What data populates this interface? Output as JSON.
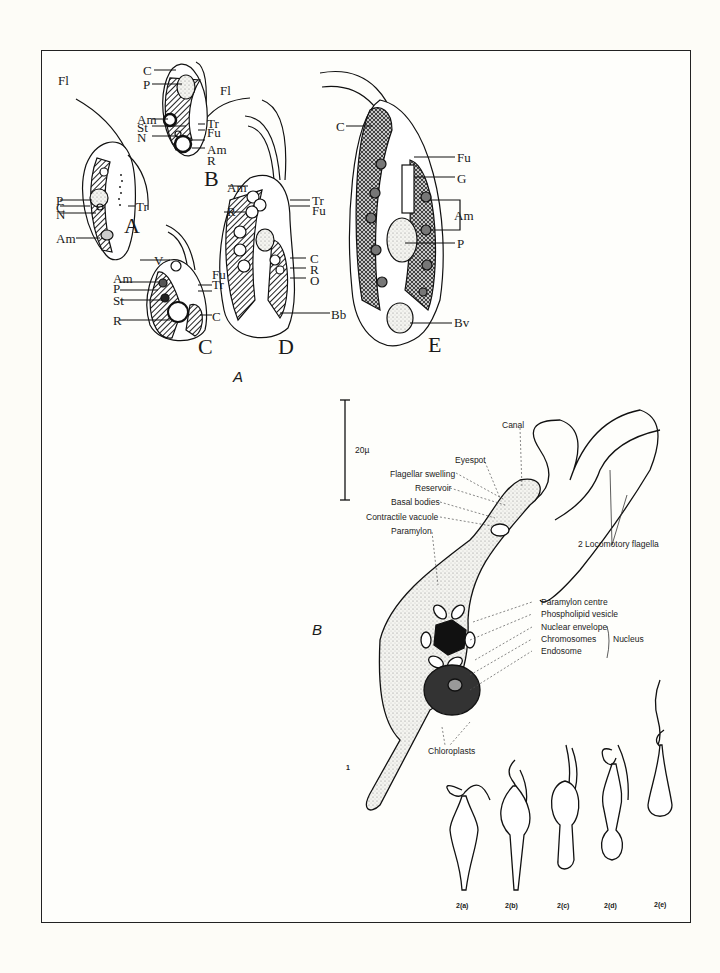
{
  "figure": {
    "panel_A": {
      "label": "A",
      "cells": [
        {
          "id": "A",
          "labels": [
            "Fl",
            "P",
            "C",
            "N",
            "Am",
            "Tr"
          ]
        },
        {
          "id": "B",
          "labels": [
            "C",
            "P",
            "Fl",
            "Am",
            "St",
            "N",
            "Tr",
            "Fu",
            "Am",
            "R"
          ]
        },
        {
          "id": "C",
          "labels": [
            "V",
            "Am",
            "P",
            "St",
            "R",
            "Fu",
            "Tr",
            "C"
          ]
        },
        {
          "id": "D",
          "labels": [
            "Am",
            "R",
            "Tr",
            "Fu",
            "C",
            "R",
            "O",
            "Bb"
          ]
        },
        {
          "id": "E",
          "labels": [
            "C",
            "Fu",
            "G",
            "Am",
            "P",
            "Bv"
          ]
        }
      ]
    },
    "panel_B": {
      "label": "B",
      "scale_bar": "20µ",
      "figure_number": "1",
      "annotations_left": [
        "Canal",
        "Eyespot",
        "Flagellar swelling",
        "Reservoir",
        "Basal bodies",
        "Contractile vacuole",
        "Paramylon"
      ],
      "annotations_right": [
        "Paramylon centre",
        "Phospholipid vesicle",
        "Nuclear envelope",
        "Chromosomes",
        "Endosome"
      ],
      "nucleus_group": "Nucleus",
      "flagella_label": "2 Locomotory flagella",
      "chloroplasts_label": "Chloroplasts",
      "stages": [
        "2(a)",
        "2(b)",
        "2(c)",
        "2(d)",
        "2(e)"
      ]
    }
  }
}
